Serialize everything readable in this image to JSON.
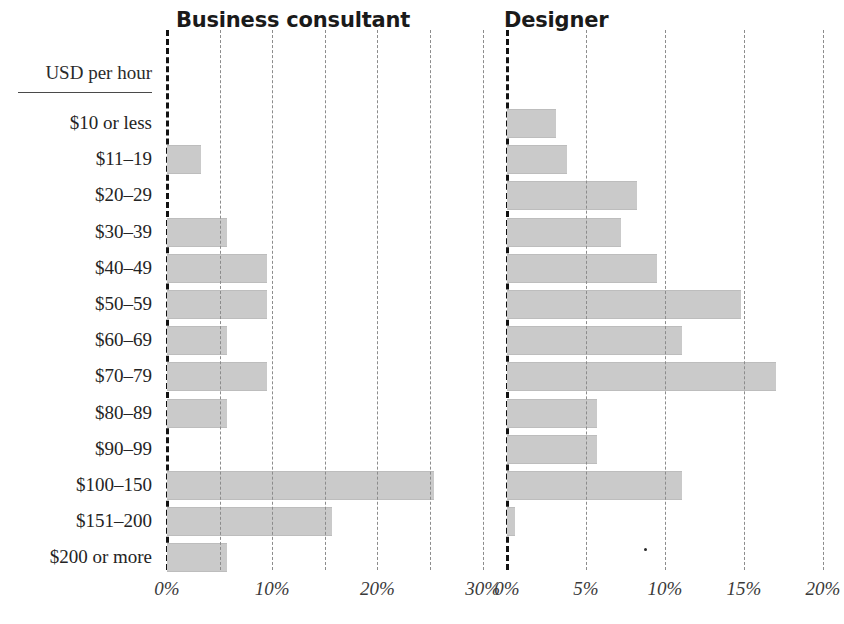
{
  "chart_data": {
    "type": "bar",
    "title": "",
    "orientation": "horizontal",
    "panels": [
      {
        "title": "Business consultant",
        "xlabel": "",
        "ylabel": "USD per hour",
        "xlim": [
          0,
          30
        ],
        "xticks": [
          0,
          10,
          20,
          30
        ],
        "xtick_labels": [
          "0%",
          "10%",
          "20%",
          "30%"
        ],
        "minor_gridlines": [
          5,
          15,
          25
        ],
        "grid": true,
        "values": [
          0,
          3.2,
          0,
          5.7,
          9.5,
          9.5,
          5.7,
          9.5,
          5.7,
          0,
          25.4,
          15.7,
          5.7
        ]
      },
      {
        "title": "Designer",
        "xlabel": "",
        "ylabel": "USD per hour",
        "xlim": [
          0,
          21
        ],
        "xticks": [
          0,
          5,
          10,
          15,
          20
        ],
        "xtick_labels": [
          "0%",
          "5%",
          "10%",
          "15%",
          "20%"
        ],
        "minor_gridlines": [],
        "grid": true,
        "values": [
          3.1,
          3.8,
          8.2,
          7.2,
          9.5,
          14.8,
          11.1,
          17.0,
          5.7,
          5.7,
          11.1,
          0.5,
          0
        ]
      }
    ],
    "categories": [
      "$10 or less",
      "$11–19",
      "$20–29",
      "$30–39",
      "$40–49",
      "$50–59",
      "$60–69",
      "$70–79",
      "$80–89",
      "$90–99",
      "$100–150",
      "$151–200",
      "$200 or more"
    ],
    "legend": [],
    "colors": {
      "bar_fill": "#cacaca",
      "bar_edge": "#bdbdbd",
      "axis": "#121212",
      "gridline": "#8c8c8c",
      "text": "#242424",
      "background": "#ffffff"
    }
  },
  "axis_header": {
    "label": "USD per hour"
  }
}
